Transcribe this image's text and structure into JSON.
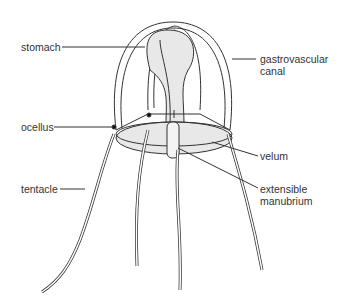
{
  "diagram": {
    "labels": {
      "stomach": "stomach",
      "gastrovascular_line1": "gastrovascular",
      "gastrovascular_line2": "canal",
      "ocellus": "ocellus",
      "velum": "velum",
      "tentacle": "tentacle",
      "manubrium_line1": "extensible",
      "manubrium_line2": "manubrium"
    },
    "colors": {
      "line": "#333333",
      "label": "#333333",
      "fill": "#e8e8e8"
    }
  }
}
